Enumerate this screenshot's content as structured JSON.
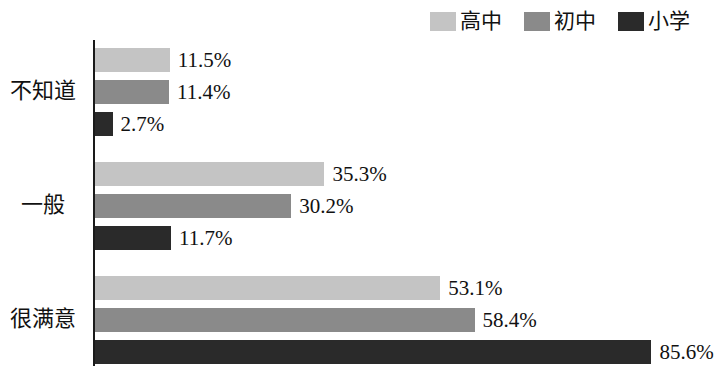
{
  "legend": {
    "position": "top-right",
    "items": [
      {
        "label": "高中",
        "color": "#c4c4c4",
        "icon": "legend-swatch-icon"
      },
      {
        "label": "初中",
        "color": "#8a8a8a",
        "icon": "legend-swatch-icon"
      },
      {
        "label": "小学",
        "color": "#2a2a2a",
        "icon": "legend-swatch-icon"
      }
    ]
  },
  "chart_data": {
    "type": "bar",
    "orientation": "horizontal",
    "title": "",
    "subtitle": "",
    "xlabel": "",
    "ylabel": "",
    "grid": false,
    "legend_position": "top-right",
    "axis_range": [
      0,
      100
    ],
    "unit": "%",
    "categories": [
      "不知道",
      "一般",
      "很满意"
    ],
    "series": [
      {
        "name": "高中",
        "color": "#c4c4c4",
        "values": [
          11.5,
          35.3,
          53.1
        ],
        "labels": [
          "11.5%",
          "35.3%",
          "53.1%"
        ]
      },
      {
        "name": "初中",
        "color": "#8a8a8a",
        "values": [
          11.4,
          30.2,
          58.4
        ],
        "labels": [
          "11.4%",
          "30.2%",
          "58.4%"
        ]
      },
      {
        "name": "小学",
        "color": "#2a2a2a",
        "values": [
          2.7,
          11.7,
          85.6
        ],
        "labels": [
          "2.7%",
          "11.7%",
          "85.6%"
        ]
      }
    ]
  },
  "layout": {
    "px_per_percent": 6.5,
    "bar_height": 24,
    "bar_gap": 8,
    "axis_x": 93,
    "groups": [
      {
        "top": 48,
        "label_top": 80
      },
      {
        "top": 162,
        "label_top": 194
      },
      {
        "top": 276,
        "label_top": 308
      }
    ]
  }
}
